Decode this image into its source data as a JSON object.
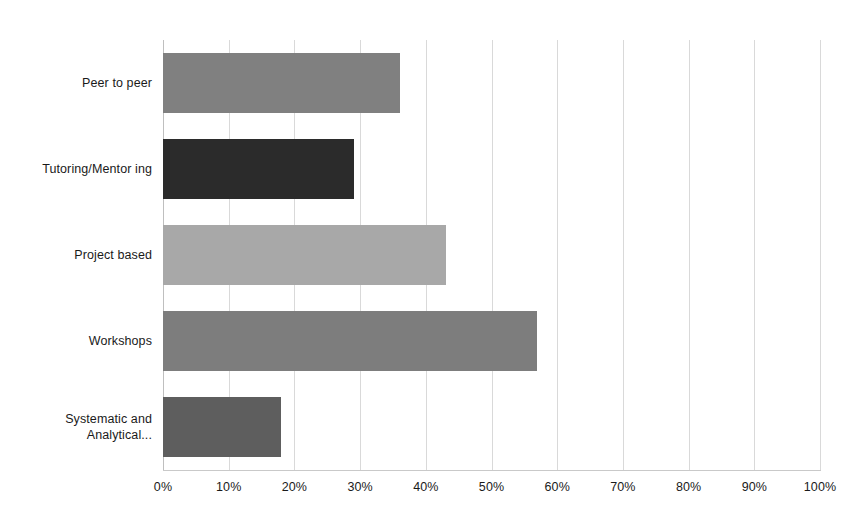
{
  "chart_data": {
    "type": "bar",
    "orientation": "horizontal",
    "title": "",
    "subtitle": "",
    "xlabel": "",
    "ylabel": "",
    "categories": [
      "Peer to peer",
      "Tutoring/Mentor ing",
      "Project based",
      "Workshops",
      "Systematic and Analytical..."
    ],
    "values": [
      36,
      29,
      43,
      57,
      18
    ],
    "value_format": "percent",
    "xlim": [
      0,
      100
    ],
    "xticks": [
      0,
      10,
      20,
      30,
      40,
      50,
      60,
      70,
      80,
      90,
      100
    ],
    "xtick_labels": [
      "0%",
      "10%",
      "20%",
      "30%",
      "40%",
      "50%",
      "60%",
      "70%",
      "80%",
      "90%",
      "100%"
    ],
    "grid": true,
    "grid_axis": "x",
    "legend": false,
    "bar_colors": [
      "#808080",
      "#2b2b2b",
      "#a8a8a8",
      "#7d7d7d",
      "#5e5e5e"
    ]
  },
  "style": {
    "background": "#ffffff",
    "gridline_color": "#d9d9d9",
    "axis_color": "#bfbfbf",
    "text_color": "#1a1a1a"
  }
}
